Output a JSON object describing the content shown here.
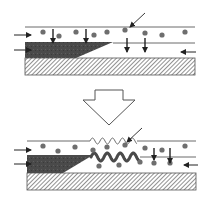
{
  "diagram": {
    "type": "process-schematic",
    "colors": {
      "line": "#6a6a6a",
      "particle": "#6e6e6e",
      "deposit": "#4a4a4a",
      "hatch": "#555555",
      "background": "#ffffff",
      "arrow": "#222222"
    },
    "panels": [
      {
        "id": "before",
        "top_line_y": 27,
        "mid_line_y": 43,
        "substrate": {
          "x": 25,
          "y": 58,
          "width": 170,
          "height": 17
        },
        "deposit_wedge": [
          [
            25,
            42
          ],
          [
            113,
            42
          ],
          [
            76,
            58
          ],
          [
            25,
            58
          ]
        ],
        "particles": [
          [
            43,
            32
          ],
          [
            59,
            36
          ],
          [
            76,
            32
          ],
          [
            94,
            35
          ],
          [
            107,
            32
          ],
          [
            125,
            30
          ],
          [
            145,
            33
          ],
          [
            162,
            35
          ],
          [
            185,
            32
          ]
        ],
        "down_arrows": [
          {
            "x": 53,
            "y1": 29,
            "y2": 43
          },
          {
            "x": 86,
            "y1": 29,
            "y2": 43
          },
          {
            "x": 127,
            "y1": 38,
            "y2": 52
          },
          {
            "x": 145,
            "y1": 38,
            "y2": 52
          }
        ],
        "side_arrows": [
          {
            "x1": 14,
            "x2": 31,
            "y": 35,
            "dir": "right"
          },
          {
            "x1": 14,
            "x2": 31,
            "y": 50,
            "dir": "right"
          },
          {
            "x1": 196,
            "x2": 181,
            "y": 52,
            "dir": "left"
          }
        ],
        "pointer_arrow": {
          "x1": 145,
          "y1": 13,
          "x2": 130,
          "y2": 27
        }
      },
      {
        "id": "after",
        "top_line_y": 141,
        "mid_line_y": 157,
        "substrate": {
          "x": 27,
          "y": 173,
          "width": 169,
          "height": 17
        },
        "deposit_wedge": [
          [
            27,
            155
          ],
          [
            93,
            155
          ],
          [
            63,
            173
          ],
          [
            27,
            173
          ]
        ],
        "particles": [
          [
            43,
            146
          ],
          [
            58,
            151
          ],
          [
            75,
            147
          ],
          [
            93,
            150
          ],
          [
            107,
            147
          ],
          [
            125,
            145
          ],
          [
            145,
            148
          ],
          [
            162,
            150
          ],
          [
            185,
            146
          ],
          [
            99,
            166
          ],
          [
            119,
            165
          ],
          [
            140,
            162
          ],
          [
            154,
            163
          ],
          [
            170,
            163
          ]
        ],
        "down_arrows": [
          {
            "x": 154,
            "y1": 148,
            "y2": 160
          },
          {
            "x": 170,
            "y1": 148,
            "y2": 163
          }
        ],
        "side_arrows": [
          {
            "x1": 14,
            "x2": 31,
            "y": 150,
            "dir": "right"
          },
          {
            "x1": 14,
            "x2": 31,
            "y": 164,
            "dir": "right"
          },
          {
            "x1": 198,
            "x2": 184,
            "y": 165,
            "dir": "left"
          }
        ],
        "pointer_arrow": {
          "x1": 142,
          "y1": 128,
          "x2": 127,
          "y2": 142
        },
        "wave_top": {
          "x_start": 90,
          "x_end": 137,
          "y": 141,
          "amp": 3,
          "period": 10,
          "stroke": 1
        },
        "wave_interface": {
          "x_start": 91,
          "x_end": 140,
          "y": 157,
          "amp": 4,
          "period": 13,
          "stroke": 3
        }
      }
    ],
    "transition_arrow": {
      "label": "hollow-down-arrow",
      "points": [
        [
          95,
          90
        ],
        [
          123,
          90
        ],
        [
          123,
          100
        ],
        [
          135,
          100
        ],
        [
          109,
          125
        ],
        [
          83,
          100
        ],
        [
          95,
          100
        ]
      ]
    }
  }
}
